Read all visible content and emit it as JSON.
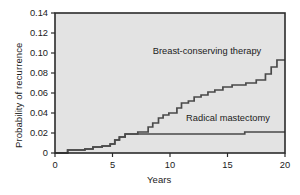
{
  "chart_data": {
    "type": "line",
    "subtype": "step-cumulative-incidence",
    "title": "",
    "xlabel": "Years",
    "ylabel": "Probability of recurrence",
    "xlim": [
      0,
      20
    ],
    "ylim": [
      0,
      0.14
    ],
    "xticks": [
      0,
      5,
      10,
      15,
      20
    ],
    "xticklabels": [
      "0",
      "5",
      "10",
      "15",
      "20"
    ],
    "yticks": [
      0,
      0.02,
      0.04,
      0.06,
      0.08,
      0.1,
      0.12,
      0.14
    ],
    "yticklabels": [
      "0",
      "0.02",
      "0.04",
      "0.06",
      "0.08",
      "0.10",
      "0.12",
      "0.14"
    ],
    "grid": false,
    "legend_position": "inline-annotation",
    "plot_background": "#e3e3e3",
    "frame_color": "#2b2b2b",
    "line_color": "#4a4a4a",
    "series": [
      {
        "name": "Breast-conserving therapy",
        "label": "Breast-conserving therapy",
        "annotation_x": 8.5,
        "annotation_y": 0.099,
        "points": [
          [
            0.0,
            0.0
          ],
          [
            1.1,
            0.0
          ],
          [
            1.1,
            0.003
          ],
          [
            2.6,
            0.003
          ],
          [
            2.6,
            0.004
          ],
          [
            3.3,
            0.004
          ],
          [
            3.3,
            0.006
          ],
          [
            4.1,
            0.006
          ],
          [
            4.1,
            0.007
          ],
          [
            4.8,
            0.007
          ],
          [
            4.8,
            0.009
          ],
          [
            5.2,
            0.009
          ],
          [
            5.2,
            0.013
          ],
          [
            5.6,
            0.013
          ],
          [
            5.6,
            0.016
          ],
          [
            6.1,
            0.016
          ],
          [
            6.1,
            0.019
          ],
          [
            7.2,
            0.019
          ],
          [
            7.2,
            0.021
          ],
          [
            8.1,
            0.021
          ],
          [
            8.1,
            0.026
          ],
          [
            8.5,
            0.026
          ],
          [
            8.5,
            0.03
          ],
          [
            9.0,
            0.03
          ],
          [
            9.0,
            0.035
          ],
          [
            9.4,
            0.035
          ],
          [
            9.4,
            0.038
          ],
          [
            9.9,
            0.038
          ],
          [
            9.9,
            0.04
          ],
          [
            10.6,
            0.04
          ],
          [
            10.6,
            0.045
          ],
          [
            11.0,
            0.045
          ],
          [
            11.0,
            0.05
          ],
          [
            11.6,
            0.05
          ],
          [
            11.6,
            0.052
          ],
          [
            12.1,
            0.052
          ],
          [
            12.1,
            0.056
          ],
          [
            12.7,
            0.056
          ],
          [
            12.7,
            0.058
          ],
          [
            13.3,
            0.058
          ],
          [
            13.3,
            0.061
          ],
          [
            13.9,
            0.061
          ],
          [
            13.9,
            0.063
          ],
          [
            14.6,
            0.063
          ],
          [
            14.6,
            0.066
          ],
          [
            15.4,
            0.066
          ],
          [
            15.4,
            0.068
          ],
          [
            16.6,
            0.068
          ],
          [
            16.6,
            0.07
          ],
          [
            17.5,
            0.07
          ],
          [
            17.5,
            0.073
          ],
          [
            18.3,
            0.073
          ],
          [
            18.3,
            0.079
          ],
          [
            18.8,
            0.079
          ],
          [
            18.8,
            0.086
          ],
          [
            19.3,
            0.086
          ],
          [
            19.3,
            0.093
          ],
          [
            20.0,
            0.093
          ]
        ]
      },
      {
        "name": "Radical mastectomy",
        "label": "Radical mastectomy",
        "annotation_x": 11.4,
        "annotation_y": 0.032,
        "points": [
          [
            0.0,
            0.0
          ],
          [
            1.1,
            0.0
          ],
          [
            1.1,
            0.003
          ],
          [
            2.6,
            0.003
          ],
          [
            2.6,
            0.004
          ],
          [
            3.3,
            0.004
          ],
          [
            3.3,
            0.006
          ],
          [
            4.1,
            0.006
          ],
          [
            4.1,
            0.007
          ],
          [
            4.8,
            0.007
          ],
          [
            4.8,
            0.009
          ],
          [
            5.2,
            0.009
          ],
          [
            5.2,
            0.013
          ],
          [
            5.6,
            0.013
          ],
          [
            5.6,
            0.016
          ],
          [
            6.1,
            0.016
          ],
          [
            6.1,
            0.019
          ],
          [
            16.5,
            0.019
          ],
          [
            16.5,
            0.021
          ],
          [
            20.0,
            0.021
          ]
        ]
      }
    ]
  }
}
